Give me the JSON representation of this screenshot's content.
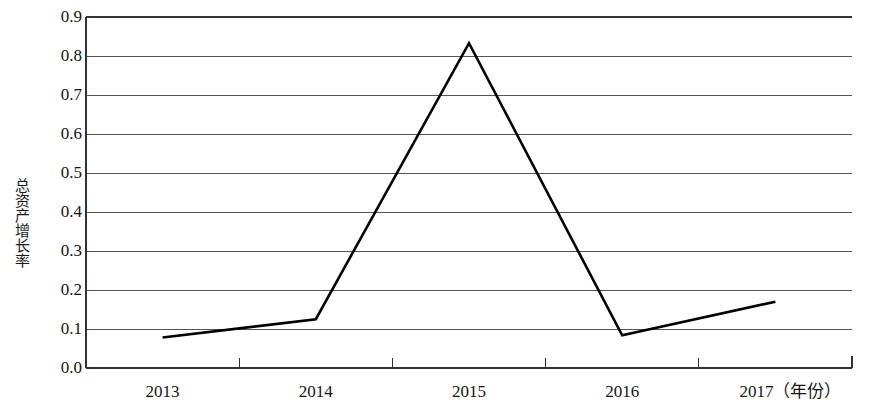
{
  "chart_data": {
    "type": "line",
    "title": "",
    "xlabel": "（年份）",
    "ylabel": "总资产增长率",
    "categories": [
      "2013",
      "2014",
      "2015",
      "2016",
      "2017"
    ],
    "values": [
      0.078,
      0.125,
      0.833,
      0.084,
      0.17
    ],
    "series": [
      {
        "name": "总资产增长率",
        "values": [
          0.078,
          0.125,
          0.833,
          0.084,
          0.17
        ]
      }
    ],
    "ylim": [
      0.0,
      0.9
    ],
    "ytick_labels": [
      "0.0",
      "0.1",
      "0.2",
      "0.3",
      "0.4",
      "0.5",
      "0.6",
      "0.7",
      "0.8",
      "0.9"
    ],
    "ytick_values": [
      0.0,
      0.1,
      0.2,
      0.3,
      0.4,
      0.5,
      0.6,
      0.7,
      0.8,
      0.9
    ],
    "xtick_labels": [
      "2013",
      "2014",
      "2015",
      "2016",
      "2017"
    ],
    "grid": true,
    "grid_axis": "y",
    "legend": false,
    "legend_position": "none",
    "line_color": "#000000",
    "grid_color": "#555555",
    "axis_color": "#333333",
    "markers": false,
    "x_axis_suffix": "（年份）",
    "x_last_tick_label": "2017（年份）"
  },
  "axis": {
    "y_title": "总资产增长率",
    "x_unit_note": "（年份）"
  }
}
